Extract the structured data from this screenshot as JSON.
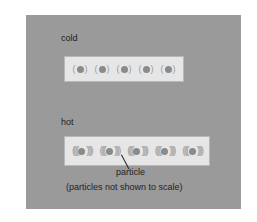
{
  "diagram": {
    "background_color": "#9a9a9a",
    "bar_color": "#e6e6e6",
    "particle_color": "#8a8a8a",
    "cold": {
      "label": "cold",
      "particle_count": 5,
      "vibration": "small",
      "left_arc": "(",
      "right_arc": ")"
    },
    "hot": {
      "label": "hot",
      "particle_count": 5,
      "vibration": "large",
      "left_arc": "((((",
      "right_arc": "))))"
    },
    "annotation": {
      "particle_label": "particle",
      "caption": "(particles not shown to scale)"
    }
  }
}
